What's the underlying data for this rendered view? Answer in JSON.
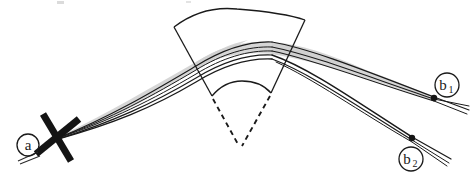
{
  "figure": {
    "background_color": "#ffffff",
    "ink_color": "#1a1a1a",
    "band_fill_color": "#cfcfcf",
    "width": 471,
    "height": 180
  },
  "labels": [
    {
      "id": "a",
      "letter": "a",
      "subscript": "",
      "cx": 28,
      "cy": 145,
      "r": 11
    },
    {
      "id": "b1",
      "letter": "b",
      "subscript": "1",
      "cx": 447,
      "cy": 85,
      "r": 12
    },
    {
      "id": "b2",
      "letter": "b",
      "subscript": "2",
      "cx": 411,
      "cy": 159,
      "r": 12
    }
  ],
  "nodes": [
    {
      "id": "node-b1",
      "x": 434,
      "y": 97,
      "r": 3.2
    },
    {
      "id": "node-b2",
      "x": 412,
      "y": 137,
      "r": 3.2
    }
  ],
  "source_marker": {
    "id": "source-cross-a",
    "x": 57,
    "y": 137,
    "stroke_width": 7,
    "arm_length": 26,
    "angle_1_deg": 58,
    "angle_2_deg": -32
  },
  "sector": {
    "id": "annular-sector",
    "apex_x": 240,
    "apex_y": 146,
    "outer_left_x": 174,
    "outer_left_y": 27,
    "outer_peak_x": 237,
    "outer_peak_y": 9,
    "outer_right_x": 305,
    "outer_right_y": 20,
    "inner_left_x": 212,
    "inner_left_y": 96,
    "inner_peak_x": 242,
    "inner_peak_y": 81,
    "inner_right_x": 271,
    "inner_right_y": 93,
    "stroke_width": 1.3,
    "dashed_stroke_width": 1.8,
    "dash_pattern": "5,4"
  },
  "ray_bundles": [
    {
      "id": "incoming-bundle-a",
      "description": "fan of rays from source a rising to the sector",
      "ray_count": 5
    },
    {
      "id": "outgoing-bundle-b1",
      "description": "upper refracted bundle to detector b1",
      "ray_count": 3
    },
    {
      "id": "outgoing-bundle-b2",
      "description": "lower refracted bundle to detector b2",
      "ray_count": 3
    }
  ],
  "artifacts": [
    {
      "id": "scan-speck-1",
      "x": 57,
      "y": 2,
      "w": 7,
      "h": 3
    },
    {
      "id": "scan-speck-2",
      "x": 186,
      "y": 2,
      "w": 5,
      "h": 2
    }
  ]
}
